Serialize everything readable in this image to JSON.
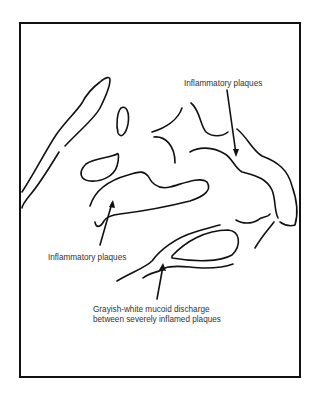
{
  "diagram": {
    "type": "medical line illustration",
    "labels": {
      "top_right": "Inflammatory plaques",
      "left": "Inflammatory plaques",
      "bottom_line1": "Grayish-white mucoid discharge",
      "bottom_line2": "between severely inflamed plaques"
    },
    "colors": {
      "stroke": "#111111",
      "text": "#333333",
      "background": "#ffffff"
    }
  }
}
